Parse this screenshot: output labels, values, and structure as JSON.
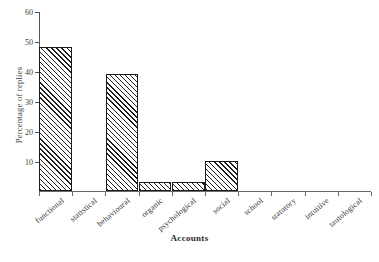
{
  "chart_data": {
    "type": "bar",
    "title": "",
    "xlabel": "Accounts",
    "ylabel": "Percentage of replies",
    "categories": [
      "functional",
      "statistical",
      "behavioural",
      "organic",
      "psychological",
      "social",
      "school",
      "statutory",
      "intuitive",
      "tautological"
    ],
    "values": [
      48,
      0,
      39,
      3,
      3,
      10,
      0,
      0,
      0,
      0
    ],
    "ylim": [
      0,
      60
    ],
    "yticks": [
      10,
      20,
      30,
      40,
      50,
      60
    ],
    "ytick_labels": [
      "10",
      "20",
      "30",
      "40",
      "50",
      "60"
    ],
    "grid": false,
    "legend": false,
    "bar_style": {
      "fill": "diagonal-hatch",
      "edge_color": "#1a1a1a",
      "face_color": "#ffffff"
    }
  }
}
